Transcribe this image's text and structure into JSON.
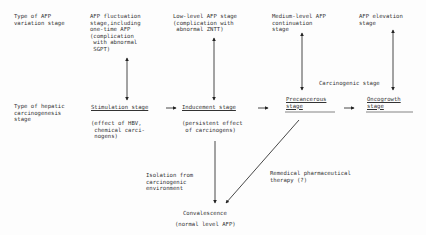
{
  "row_labels": {
    "afp_variation": "Type of AFP\nvariation stage",
    "hepatic_carcinogenesis": "Type of hepatic\ncarcinogenesis\nstage"
  },
  "afp_stages": [
    {
      "label": "AFP fluctuation\nstage,including\none-time AFP\n(complication\n with abnormal\n SGPT)"
    },
    {
      "label": "Low-level AFP stage\n(complication with\n abnormal ZNTT)"
    },
    {
      "label": "Medium-level AFP\ncontinuation\nstage"
    },
    {
      "label": "AFP elevation\nstage"
    }
  ],
  "carcinogenesis_stages": [
    {
      "title": "Stimulation stage",
      "note": "(effect of HBV,\n chemical carci-\n nogens)"
    },
    {
      "title": "Inducement stage",
      "note": "(persistent effect\n of carcinogens)"
    },
    {
      "title": "Precancerous\nstage",
      "note": ""
    },
    {
      "title": "Oncogrowth\nstage",
      "note": ""
    }
  ],
  "group_label": "Carcinogenic stage",
  "paths": {
    "isolation": "Isolation from\ncarcinogenic\nenvironment",
    "therapy": "Remedical pharmaceutical\ntherapy (?)"
  },
  "outcome": {
    "title": "Convalescence",
    "note": "(normal level AFP)"
  }
}
